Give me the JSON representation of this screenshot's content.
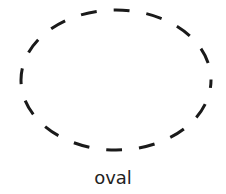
{
  "shape": {
    "name": "oval",
    "stroke_color": "#1a1a1a",
    "style": "dashed"
  },
  "label": "oval"
}
